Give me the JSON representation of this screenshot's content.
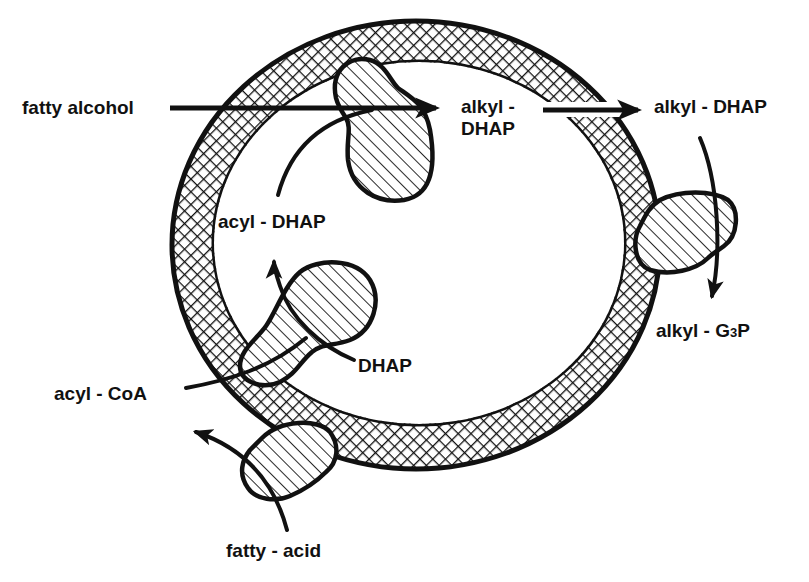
{
  "figure": {
    "kind": "peroxisomal ether-lipid biosynthesis schematic",
    "colors": {
      "ink": "#111111",
      "background": "#ffffff"
    }
  },
  "membrane": {
    "label": "",
    "pattern": "crosshatch"
  },
  "enzymes": [
    {
      "id": "enzyme-top",
      "pattern": "diagonal-hatch"
    },
    {
      "id": "enzyme-left",
      "pattern": "diagonal-hatch"
    },
    {
      "id": "enzyme-right",
      "pattern": "diagonal-hatch"
    },
    {
      "id": "enzyme-bottom",
      "pattern": "diagonal-hatch"
    }
  ],
  "labels": {
    "fatty_alcohol": "fatty alcohol",
    "alkyl_dhap_inner_line1": "alkyl -",
    "alkyl_dhap_inner_line2": "DHAP",
    "alkyl_dhap_outer": "alkyl - DHAP",
    "acyl_dhap": "acyl - DHAP",
    "dhap": "DHAP",
    "acyl_coa": "acyl - CoA",
    "alkyl_g3p_main": "alkyl - G",
    "alkyl_g3p_sub": "3",
    "alkyl_g3p_end": "P",
    "fatty_acid": "fatty - acid"
  },
  "arrows": [
    {
      "from": "fatty alcohol",
      "to": "alkyl - DHAP (inside)"
    },
    {
      "from": "acyl - DHAP",
      "to": "alkyl - DHAP (inside)"
    },
    {
      "from": "DHAP",
      "to": "acyl - DHAP"
    },
    {
      "from": "acyl - CoA",
      "to": "acyl - DHAP"
    },
    {
      "from": "alkyl - DHAP (inside)",
      "to": "alkyl - DHAP (outside)"
    },
    {
      "from": "alkyl - DHAP (outside)",
      "to": "alkyl - G3P"
    },
    {
      "from": "fatty - acid",
      "to": "acyl - CoA"
    }
  ]
}
